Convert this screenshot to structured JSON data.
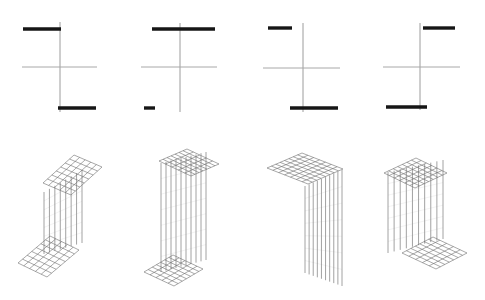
{
  "canvas": {
    "width": 485,
    "height": 300,
    "background": "#ffffff"
  },
  "styles": {
    "flange_color": "#161616",
    "flange_stroke_width": 3.4,
    "axis_color": "#a8a8a8",
    "axis_stroke_width": 1,
    "web2d_color": "#9c9c9c",
    "web2d_stroke_width": 1,
    "mesh_color": "#6e6e6e",
    "mesh_stroke_width": 0.6,
    "web3d_color": "#8a8a8a",
    "web3d_stroke_width": 0.8,
    "web3d_faint_color": "#c9c9c9",
    "web3d_faint_stroke_width": 0.5,
    "web3d_faint_rows": 7
  },
  "cross_sections": [
    {
      "id": "cross-section-1",
      "web": {
        "x": 60,
        "y1": 22,
        "y2": 112
      },
      "axis": {
        "y": 67,
        "x1": 22,
        "x2": 97
      },
      "top_flange": {
        "y": 29,
        "x1": 23,
        "x2": 61
      },
      "bottom_flange": {
        "y": 108,
        "x1": 58,
        "x2": 96
      }
    },
    {
      "id": "cross-section-2",
      "web": {
        "x": 180,
        "y1": 23,
        "y2": 112
      },
      "axis": {
        "y": 67,
        "x1": 141,
        "x2": 217
      },
      "top_flange": {
        "y": 29,
        "x1": 152,
        "x2": 215
      },
      "bottom_flange": {
        "y": 108,
        "x1": 144,
        "x2": 155
      }
    },
    {
      "id": "cross-section-3",
      "web": {
        "x": 303,
        "y1": 23,
        "y2": 112
      },
      "axis": {
        "y": 68,
        "x1": 263,
        "x2": 340
      },
      "top_flange": {
        "y": 28,
        "x1": 268,
        "x2": 292
      },
      "bottom_flange": {
        "y": 108,
        "x1": 290,
        "x2": 338
      }
    },
    {
      "id": "cross-section-4",
      "web": {
        "x": 420,
        "y1": 23,
        "y2": 110
      },
      "axis": {
        "y": 67,
        "x1": 383,
        "x2": 460
      },
      "top_flange": {
        "y": 28,
        "x1": 423,
        "x2": 455
      },
      "bottom_flange": {
        "y": 107,
        "x1": 386,
        "x2": 427
      }
    }
  ],
  "members": [
    {
      "id": "member-1",
      "top_band": {
        "o": [
          43,
          183
        ],
        "u": [
          31,
          -28
        ],
        "v": [
          28,
          12
        ],
        "nu": 7,
        "nv": 5
      },
      "bottom_band": {
        "o": [
          18,
          263
        ],
        "u": [
          32,
          -27
        ],
        "v": [
          29,
          14
        ],
        "nu": 7,
        "nv": 5
      },
      "web": {
        "x1": 44,
        "x2": 82,
        "lines": 8,
        "top_y1": 192,
        "top_y2": 170,
        "bot_y1": 254,
        "bot_y2": 243
      }
    },
    {
      "id": "member-2",
      "top_band": {
        "o": [
          159,
          161
        ],
        "u": [
          28,
          -12
        ],
        "v": [
          32,
          15
        ],
        "nu": 7,
        "nv": 5
      },
      "bottom_band": {
        "o": [
          144,
          272
        ],
        "u": [
          29,
          -17
        ],
        "v": [
          30,
          14
        ],
        "nu": 7,
        "nv": 5
      },
      "web": {
        "x1": 161,
        "x2": 206,
        "lines": 10,
        "top_y1": 163,
        "top_y2": 152,
        "bot_y1": 272,
        "bot_y2": 260
      }
    },
    {
      "id": "member-3",
      "top_band": {
        "o": [
          267,
          168
        ],
        "u": [
          35,
          -15
        ],
        "v": [
          41,
          16
        ],
        "nu": 8,
        "nv": 7
      },
      "bottom_band": null,
      "web": {
        "x1": 305,
        "x2": 342,
        "lines": 10,
        "top_y1": 186,
        "top_y2": 170,
        "bot_y1": 273,
        "bot_y2": 286
      }
    },
    {
      "id": "member-4",
      "top_band": {
        "o": [
          384,
          173
        ],
        "u": [
          32,
          -15
        ],
        "v": [
          31,
          15
        ],
        "nu": 7,
        "nv": 6
      },
      "bottom_band": {
        "o": [
          402,
          253
        ],
        "u": [
          31,
          -16
        ],
        "v": [
          34,
          16
        ],
        "nu": 7,
        "nv": 5
      },
      "web": {
        "x1": 388,
        "x2": 443,
        "lines": 10,
        "top_y1": 172,
        "top_y2": 160,
        "bot_y1": 253,
        "bot_y2": 239
      }
    }
  ]
}
